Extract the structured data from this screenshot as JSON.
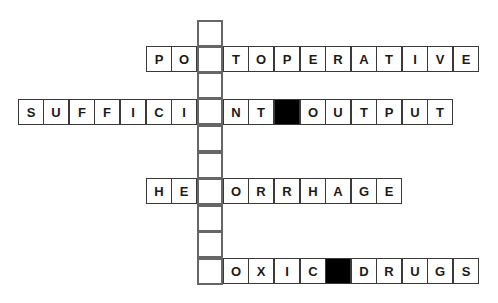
{
  "puzzle": {
    "vertical_column": {
      "cells": 10,
      "values": [
        "",
        "",
        "",
        "",
        "",
        "",
        "",
        "",
        "",
        ""
      ]
    },
    "rows": [
      {
        "id": "row1",
        "answer_cell_index": 1,
        "left_letters": [
          "P",
          "O"
        ],
        "right_letters": [
          "T",
          "O",
          "P",
          "E",
          "R",
          "A",
          "T",
          "I",
          "V",
          "E"
        ]
      },
      {
        "id": "row2",
        "answer_cell_index": 3,
        "left_letters": [
          "S",
          "U",
          "F",
          "F",
          "I",
          "C",
          "I"
        ],
        "right_letters": [
          "N",
          "T",
          "#",
          "O",
          "U",
          "T",
          "P",
          "U",
          "T"
        ]
      },
      {
        "id": "row3",
        "answer_cell_index": 6,
        "left_letters": [
          "H",
          "E"
        ],
        "right_letters": [
          "O",
          "R",
          "R",
          "H",
          "A",
          "G",
          "E"
        ]
      },
      {
        "id": "row4",
        "answer_cell_index": 9,
        "left_letters": [],
        "right_letters": [
          "O",
          "X",
          "I",
          "C",
          "#",
          "D",
          "R",
          "U",
          "G",
          "S"
        ]
      }
    ]
  }
}
